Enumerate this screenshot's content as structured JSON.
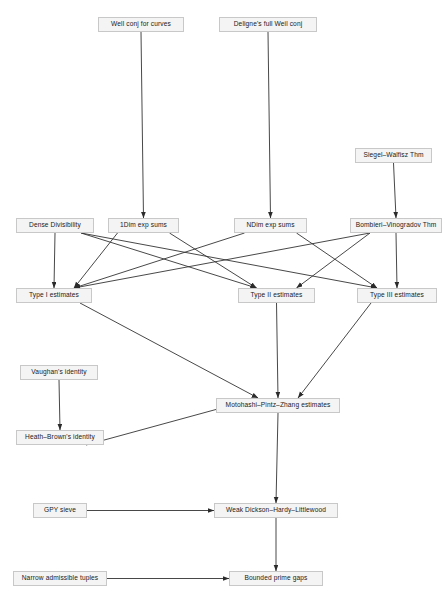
{
  "diagram": {
    "type": "directed-acyclic-graph",
    "canvas": {
      "width": 445,
      "height": 606
    },
    "style": {
      "node_fill": "#f4f4f4",
      "node_border": "#c8c8c8",
      "node_text": "#1a1a1a",
      "edge_color": "#333333",
      "background": "#ffffff"
    },
    "nodes": [
      {
        "id": "well_conj_curves",
        "label": "Well conj for curves",
        "x": 98,
        "y": 17,
        "w": 86,
        "h": 15
      },
      {
        "id": "deligne_weil",
        "label": "Deligne's full Weil conj",
        "x": 219,
        "y": 17,
        "w": 98,
        "h": 15
      },
      {
        "id": "siegel_walfisz",
        "label": "Siegel–Walfisz Thm",
        "x": 355,
        "y": 148,
        "w": 77,
        "h": 15
      },
      {
        "id": "dense_divisibility",
        "label": "Dense Divisibility",
        "x": 16,
        "y": 218,
        "w": 78,
        "h": 15
      },
      {
        "id": "onedim_exp_sums",
        "label": "1Dim exp sums",
        "x": 108,
        "y": 218,
        "w": 71,
        "h": 15
      },
      {
        "id": "ndim_exp_sums",
        "label": "NDim exp sums",
        "x": 234,
        "y": 218,
        "w": 73,
        "h": 15
      },
      {
        "id": "bombieri_vinogradov",
        "label": "Bombieri–Vinogradov Thm",
        "x": 350,
        "y": 218,
        "w": 92,
        "h": 15
      },
      {
        "id": "type_i",
        "label": "Type I estimates",
        "x": 16,
        "y": 288,
        "w": 76,
        "h": 15
      },
      {
        "id": "type_ii",
        "label": "Type II estimates",
        "x": 238,
        "y": 288,
        "w": 77,
        "h": 15
      },
      {
        "id": "type_iii",
        "label": "Type III estimates",
        "x": 357,
        "y": 288,
        "w": 80,
        "h": 15
      },
      {
        "id": "vaughan",
        "label": "Vaughan's identity",
        "x": 20,
        "y": 365,
        "w": 78,
        "h": 15
      },
      {
        "id": "heath_brown",
        "label": "Heath–Brown's identity",
        "x": 16,
        "y": 430,
        "w": 88,
        "h": 15
      },
      {
        "id": "mpz",
        "label": "Motohashi–Pintz–Zhang estimates",
        "x": 216,
        "y": 398,
        "w": 124,
        "h": 15
      },
      {
        "id": "gpy_sieve",
        "label": "GPY sieve",
        "x": 33,
        "y": 503,
        "w": 54,
        "h": 15
      },
      {
        "id": "weak_dhl",
        "label": "Weak Dickson–Hardy–Littlewood",
        "x": 214,
        "y": 503,
        "w": 124,
        "h": 15
      },
      {
        "id": "narrow_tuples",
        "label": "Narrow admissible tuples",
        "x": 13,
        "y": 571,
        "w": 94,
        "h": 15
      },
      {
        "id": "bounded_gaps",
        "label": "Bounded prime gaps",
        "x": 229,
        "y": 571,
        "w": 94,
        "h": 15
      }
    ],
    "edges": [
      {
        "from": "well_conj_curves",
        "to": "onedim_exp_sums",
        "kind": "vertical"
      },
      {
        "from": "deligne_weil",
        "to": "ndim_exp_sums",
        "kind": "vertical"
      },
      {
        "from": "siegel_walfisz",
        "to": "bombieri_vinogradov",
        "kind": "vertical"
      },
      {
        "from": "dense_divisibility",
        "to": "type_i",
        "kind": "vertical"
      },
      {
        "from": "dense_divisibility",
        "to": "type_ii",
        "kind": "diagonal"
      },
      {
        "from": "dense_divisibility",
        "to": "type_iii",
        "kind": "diagonal"
      },
      {
        "from": "onedim_exp_sums",
        "to": "type_i",
        "kind": "diagonal"
      },
      {
        "from": "onedim_exp_sums",
        "to": "type_ii",
        "kind": "diagonal"
      },
      {
        "from": "ndim_exp_sums",
        "to": "type_i",
        "kind": "diagonal"
      },
      {
        "from": "ndim_exp_sums",
        "to": "type_iii",
        "kind": "diagonal"
      },
      {
        "from": "bombieri_vinogradov",
        "to": "type_i",
        "kind": "diagonal"
      },
      {
        "from": "bombieri_vinogradov",
        "to": "type_ii",
        "kind": "diagonal"
      },
      {
        "from": "bombieri_vinogradov",
        "to": "type_iii",
        "kind": "vertical"
      },
      {
        "from": "type_i",
        "to": "mpz",
        "kind": "diagonal"
      },
      {
        "from": "type_ii",
        "to": "mpz",
        "kind": "vertical"
      },
      {
        "from": "type_iii",
        "to": "mpz",
        "kind": "diagonal"
      },
      {
        "from": "vaughan",
        "to": "heath_brown",
        "kind": "vertical"
      },
      {
        "from": "heath_brown",
        "to": "mpz",
        "kind": "diagonal"
      },
      {
        "from": "mpz",
        "to": "weak_dhl",
        "kind": "vertical"
      },
      {
        "from": "gpy_sieve",
        "to": "weak_dhl",
        "kind": "horizontal"
      },
      {
        "from": "weak_dhl",
        "to": "bounded_gaps",
        "kind": "vertical"
      },
      {
        "from": "narrow_tuples",
        "to": "bounded_gaps",
        "kind": "horizontal"
      }
    ]
  }
}
